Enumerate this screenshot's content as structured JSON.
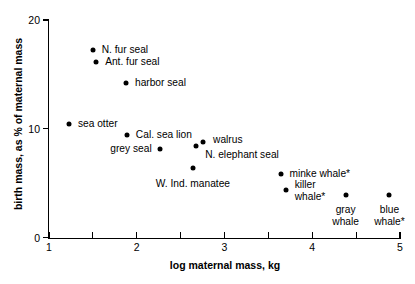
{
  "chart_data": {
    "type": "scatter",
    "title": "",
    "xlabel": "log maternal mass, kg",
    "ylabel": "birth mass, as % of maternal mass",
    "xlim": [
      1,
      5
    ],
    "ylim": [
      0,
      20
    ],
    "x_ticks": [
      1,
      1.5,
      2,
      2.5,
      3,
      3.5,
      4,
      4.5,
      5
    ],
    "x_tick_labels": [
      "1",
      "",
      "2",
      "",
      "3",
      "",
      "4",
      "",
      "5"
    ],
    "y_ticks": [
      0,
      10,
      20
    ],
    "y_tick_labels": [
      "0",
      "10",
      "20"
    ],
    "grid": false,
    "legend": "none",
    "marker_color": "#000000",
    "points": [
      {
        "label": "N. fur seal",
        "x": 1.5,
        "y": 17.2,
        "label_x": 1.6,
        "label_y": 17.2,
        "anchor": "left"
      },
      {
        "label": "Ant. fur seal",
        "x": 1.54,
        "y": 16.15,
        "label_x": 1.64,
        "label_y": 16.15,
        "anchor": "left"
      },
      {
        "label": "harbor seal",
        "x": 1.88,
        "y": 14.2,
        "label_x": 1.98,
        "label_y": 14.2,
        "anchor": "left"
      },
      {
        "label": "sea otter",
        "x": 1.23,
        "y": 10.45,
        "label_x": 1.33,
        "label_y": 10.45,
        "anchor": "left"
      },
      {
        "label": "Cal. sea lion",
        "x": 1.89,
        "y": 9.45,
        "label_x": 1.99,
        "label_y": 9.45,
        "anchor": "left"
      },
      {
        "label": "grey seal",
        "x": 2.27,
        "y": 8.15,
        "label_x": 2.17,
        "label_y": 8.15,
        "anchor": "right"
      },
      {
        "label": "walrus",
        "x": 2.75,
        "y": 8.8,
        "label_x": 2.87,
        "label_y": 8.95,
        "anchor": "left"
      },
      {
        "label": "N. elephant seal",
        "x": 2.67,
        "y": 8.45,
        "label_x": 2.78,
        "label_y": 7.55,
        "anchor": "left"
      },
      {
        "label": "W. Ind. manatee",
        "x": 2.64,
        "y": 6.4,
        "label_x": 2.64,
        "label_y": 5.45,
        "anchor": "center"
      },
      {
        "label": "minke whale*",
        "x": 3.64,
        "y": 5.8,
        "label_x": 3.74,
        "label_y": 5.8,
        "anchor": "left"
      },
      {
        "label": "killer\nwhale*",
        "x": 3.7,
        "y": 4.35,
        "label_x": 3.8,
        "label_y": 4.35,
        "anchor": "left"
      },
      {
        "label": "gray\nwhale",
        "x": 4.38,
        "y": 3.9,
        "label_x": 4.38,
        "label_y": 3.05,
        "anchor": "center"
      },
      {
        "label": "blue\nwhale*",
        "x": 4.88,
        "y": 3.9,
        "label_x": 4.88,
        "label_y": 3.05,
        "anchor": "center"
      }
    ]
  }
}
